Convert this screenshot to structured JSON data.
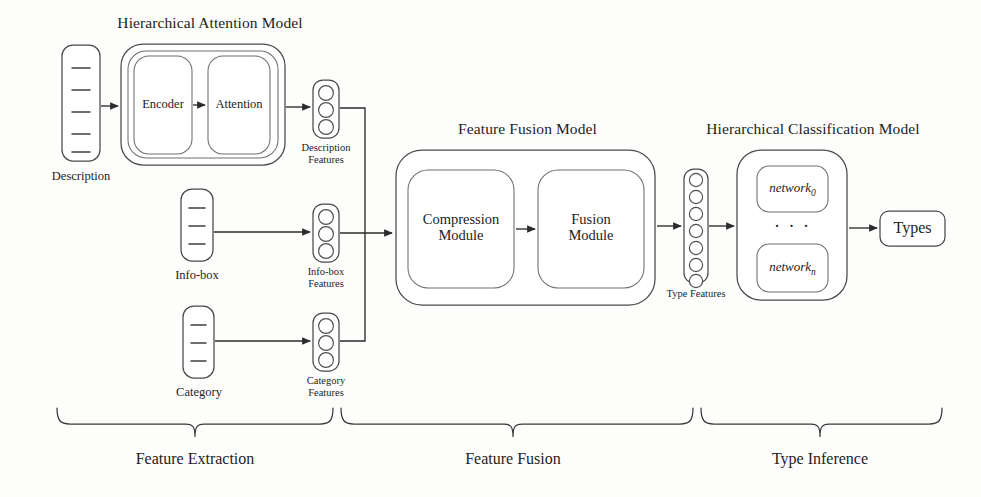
{
  "figure": {
    "kind": "model-architecture-block-diagram",
    "width": 981,
    "height": 497,
    "background_color": "#fdfdfc",
    "stroke_color": "#4a4a4a",
    "text_color": "#1d1d1d"
  },
  "titles": {
    "hierarchical_attention_model": "Hierarchical Attention Model",
    "feature_fusion_model": "Feature Fusion Model",
    "hierarchical_classification_model": "Hierarchical Classification Model"
  },
  "inputs": [
    {
      "id": "description",
      "label": "Description",
      "lines": 5
    },
    {
      "id": "infobox",
      "label": "Info-box",
      "lines": 3
    },
    {
      "id": "category",
      "label": "Category",
      "lines": 3
    }
  ],
  "feature_columns": [
    {
      "id": "description-features",
      "label": "Description\nFeatures",
      "circles": 3
    },
    {
      "id": "infobox-features",
      "label": "Info-box\nFeatures",
      "circles": 3
    },
    {
      "id": "category-features",
      "label": "Category\nFeatures",
      "circles": 3
    },
    {
      "id": "type-features",
      "label": "Type Features",
      "circles": 7
    }
  ],
  "modules": {
    "encoder": "Encoder",
    "attention": "Attention",
    "compression_module": "Compression\nModule",
    "fusion_module": "Fusion\nModule",
    "network_first": "network",
    "network_first_sub": "0",
    "network_last": "network",
    "network_last_sub": "n",
    "network_ellipsis": "· · ·"
  },
  "output": {
    "types": "Types"
  },
  "stages": [
    {
      "id": "feature-extraction",
      "label": "Feature Extraction"
    },
    {
      "id": "feature-fusion",
      "label": "Feature Fusion"
    },
    {
      "id": "type-inference",
      "label": "Type Inference"
    }
  ]
}
